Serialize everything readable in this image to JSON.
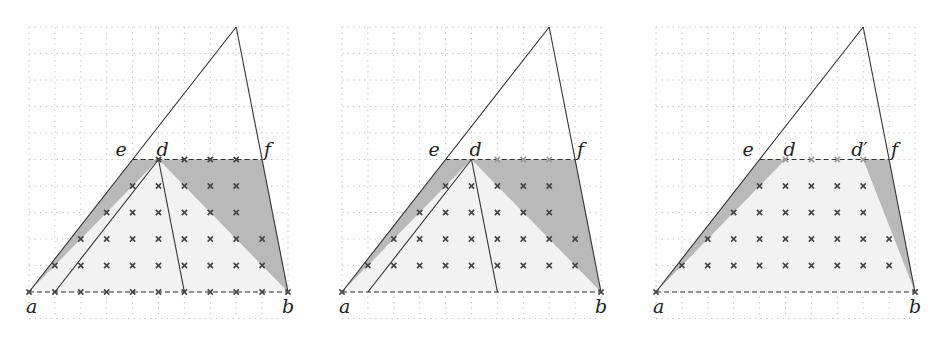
{
  "colors": {
    "grid": "#c8c8c8",
    "line": "#333333",
    "dark_fill": "#b9b9b9",
    "light_fill": "#f2f2f2",
    "cross": "#444444",
    "cross_faint": "#9a9a9a"
  },
  "panels": [
    {
      "id": "panel-1",
      "points": {
        "a": [
          0,
          0
        ],
        "b": [
          10,
          0
        ],
        "e": [
          4,
          5
        ],
        "d": [
          5,
          5
        ],
        "f": [
          9,
          5
        ],
        "apex": [
          8,
          10
        ]
      },
      "labels": [
        {
          "text": "a",
          "at": "a"
        },
        {
          "text": "b",
          "at": "b"
        },
        {
          "text": "e",
          "at": "e"
        },
        {
          "text": "d",
          "at": "d"
        },
        {
          "text": "f",
          "at": "f"
        }
      ],
      "dark_regions": [
        [
          [
            0,
            0
          ],
          [
            4,
            5
          ],
          [
            5,
            5
          ]
        ],
        [
          [
            5,
            5
          ],
          [
            9,
            5
          ],
          [
            10,
            0
          ]
        ]
      ],
      "light_regions": [
        [
          [
            0,
            0
          ],
          [
            5,
            5
          ],
          [
            10,
            0
          ]
        ]
      ],
      "segments": [
        [
          [
            1,
            0
          ],
          [
            5,
            5
          ]
        ],
        [
          [
            5,
            5
          ],
          [
            6,
            0
          ]
        ]
      ],
      "crosses": [
        {
          "row": 0,
          "cols": [
            0,
            1,
            2,
            3,
            4,
            5,
            6,
            7,
            8,
            9,
            10
          ]
        },
        {
          "row": 1,
          "cols": [
            1,
            2,
            3,
            4,
            5,
            6,
            7,
            8,
            9
          ]
        },
        {
          "row": 2,
          "cols": [
            2,
            3,
            4,
            5,
            6,
            7,
            8,
            9
          ]
        },
        {
          "row": 3,
          "cols": [
            3,
            4,
            5,
            6,
            7,
            8
          ]
        },
        {
          "row": 4,
          "cols": [
            4,
            5,
            6,
            7,
            8
          ]
        },
        {
          "row": 5,
          "cols": [
            5,
            6,
            7,
            8
          ]
        }
      ],
      "faint_crosses": []
    },
    {
      "id": "panel-2",
      "points": {
        "a": [
          0,
          0
        ],
        "b": [
          10,
          0
        ],
        "e": [
          4,
          5
        ],
        "d": [
          5,
          5
        ],
        "f": [
          9,
          5
        ],
        "apex": [
          8,
          10
        ]
      },
      "labels": [
        {
          "text": "a",
          "at": "a"
        },
        {
          "text": "b",
          "at": "b"
        },
        {
          "text": "e",
          "at": "e"
        },
        {
          "text": "d",
          "at": "d"
        },
        {
          "text": "f",
          "at": "f"
        }
      ],
      "dark_regions": [
        [
          [
            0,
            0
          ],
          [
            4,
            5
          ],
          [
            5,
            5
          ]
        ],
        [
          [
            5,
            5
          ],
          [
            9,
            5
          ],
          [
            10,
            0
          ]
        ]
      ],
      "light_regions": [
        [
          [
            0,
            0
          ],
          [
            5,
            5
          ],
          [
            10,
            0
          ]
        ]
      ],
      "segments": [
        [
          [
            1,
            0
          ],
          [
            5,
            5
          ]
        ],
        [
          [
            5,
            5
          ],
          [
            6,
            0
          ]
        ]
      ],
      "crosses": [
        {
          "row": 0,
          "cols": [
            0,
            10
          ]
        },
        {
          "row": 1,
          "cols": [
            1,
            2,
            3,
            4,
            5,
            6,
            7,
            8,
            9
          ]
        },
        {
          "row": 2,
          "cols": [
            2,
            3,
            4,
            5,
            6,
            7,
            8,
            9
          ]
        },
        {
          "row": 3,
          "cols": [
            3,
            4,
            5,
            6,
            7,
            8
          ]
        },
        {
          "row": 4,
          "cols": [
            4,
            5,
            6,
            7,
            8
          ]
        }
      ],
      "faint_crosses": [
        {
          "row": 5,
          "cols": [
            6,
            7,
            8
          ]
        }
      ]
    },
    {
      "id": "panel-3",
      "points": {
        "a": [
          0,
          0
        ],
        "b": [
          10,
          0
        ],
        "e": [
          4,
          5
        ],
        "d": [
          5,
          5
        ],
        "d_prime": [
          8,
          5
        ],
        "f": [
          9,
          5
        ],
        "apex": [
          8,
          10
        ]
      },
      "labels": [
        {
          "text": "a",
          "at": "a"
        },
        {
          "text": "b",
          "at": "b"
        },
        {
          "text": "e",
          "at": "e"
        },
        {
          "text": "d",
          "at": "d"
        },
        {
          "text": "d′",
          "at": "d_prime"
        },
        {
          "text": "f",
          "at": "f"
        }
      ],
      "dark_regions": [
        [
          [
            0,
            0
          ],
          [
            4,
            5
          ],
          [
            5,
            5
          ]
        ],
        [
          [
            8,
            5
          ],
          [
            9,
            5
          ],
          [
            10,
            0
          ]
        ]
      ],
      "light_regions": [
        [
          [
            0,
            0
          ],
          [
            5,
            5
          ],
          [
            8,
            5
          ],
          [
            10,
            0
          ]
        ]
      ],
      "segments": [],
      "crosses": [
        {
          "row": 0,
          "cols": [
            0,
            10
          ]
        },
        {
          "row": 1,
          "cols": [
            1,
            2,
            3,
            4,
            5,
            6,
            7,
            8,
            9
          ]
        },
        {
          "row": 2,
          "cols": [
            2,
            3,
            4,
            5,
            6,
            7,
            8,
            9
          ]
        },
        {
          "row": 3,
          "cols": [
            3,
            4,
            5,
            6,
            7,
            8
          ]
        },
        {
          "row": 4,
          "cols": [
            4,
            5,
            6,
            7,
            8
          ]
        }
      ],
      "faint_crosses": [
        {
          "row": 5,
          "cols": [
            5,
            6,
            7,
            8
          ]
        }
      ]
    }
  ]
}
